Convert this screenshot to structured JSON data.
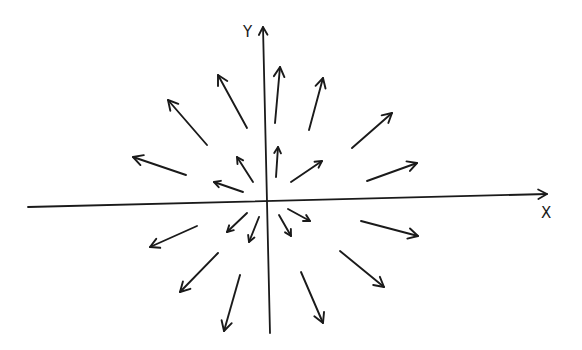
{
  "diagram": {
    "type": "vector-field-sketch",
    "stroke_color": "#1a1a1a",
    "background": "#ffffff",
    "axes": {
      "x": {
        "label": "X",
        "from": [
          28,
          207
        ],
        "to": [
          547,
          194
        ],
        "label_pos": [
          541,
          218
        ]
      },
      "y": {
        "label": "Y",
        "from": [
          270,
          333
        ],
        "to": [
          263,
          27
        ],
        "label_pos": [
          243,
          37
        ]
      },
      "origin": [
        266,
        203
      ]
    },
    "arrows": [
      {
        "quadrant": "upper-left",
        "tail": [
          247,
          128
        ],
        "head": [
          218,
          75
        ]
      },
      {
        "quadrant": "upper-left",
        "tail": [
          207,
          145
        ],
        "head": [
          168,
          100
        ]
      },
      {
        "quadrant": "upper-left",
        "tail": [
          186,
          175
        ],
        "head": [
          133,
          157
        ]
      },
      {
        "quadrant": "upper-left",
        "tail": [
          253,
          182
        ],
        "head": [
          237,
          157
        ]
      },
      {
        "quadrant": "upper-left",
        "tail": [
          243,
          192
        ],
        "head": [
          214,
          182
        ]
      },
      {
        "quadrant": "upper-right",
        "tail": [
          275,
          123
        ],
        "head": [
          280,
          67
        ]
      },
      {
        "quadrant": "upper-right",
        "tail": [
          309,
          130
        ],
        "head": [
          323,
          78
        ]
      },
      {
        "quadrant": "upper-right",
        "tail": [
          352,
          148
        ],
        "head": [
          392,
          113
        ]
      },
      {
        "quadrant": "upper-right",
        "tail": [
          276,
          177
        ],
        "head": [
          278,
          147
        ]
      },
      {
        "quadrant": "upper-right",
        "tail": [
          291,
          182
        ],
        "head": [
          322,
          161
        ]
      },
      {
        "quadrant": "upper-right",
        "tail": [
          367,
          181
        ],
        "head": [
          417,
          163
        ]
      },
      {
        "quadrant": "lower-left",
        "tail": [
          197,
          226
        ],
        "head": [
          150,
          247
        ]
      },
      {
        "quadrant": "lower-left",
        "tail": [
          247,
          213
        ],
        "head": [
          227,
          232
        ]
      },
      {
        "quadrant": "lower-left",
        "tail": [
          259,
          217
        ],
        "head": [
          249,
          242
        ]
      },
      {
        "quadrant": "lower-left",
        "tail": [
          218,
          253
        ],
        "head": [
          180,
          292
        ]
      },
      {
        "quadrant": "lower-left",
        "tail": [
          240,
          275
        ],
        "head": [
          224,
          331
        ]
      },
      {
        "quadrant": "lower-right",
        "tail": [
          288,
          209
        ],
        "head": [
          310,
          221
        ]
      },
      {
        "quadrant": "lower-right",
        "tail": [
          279,
          215
        ],
        "head": [
          291,
          236
        ]
      },
      {
        "quadrant": "lower-right",
        "tail": [
          361,
          221
        ],
        "head": [
          418,
          236
        ]
      },
      {
        "quadrant": "lower-right",
        "tail": [
          340,
          251
        ],
        "head": [
          384,
          287
        ]
      },
      {
        "quadrant": "lower-right",
        "tail": [
          301,
          272
        ],
        "head": [
          323,
          323
        ]
      }
    ]
  }
}
